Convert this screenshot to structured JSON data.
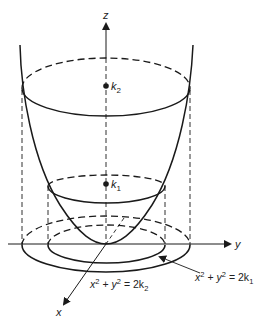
{
  "figure": {
    "type": "3D paraboloid with level curves",
    "axes": {
      "z_label": "z",
      "y_label": "y",
      "x_label": "x"
    },
    "points": {
      "k2_label": "k",
      "k2_sub": "2",
      "k1_label": "k",
      "k1_sub": "1"
    },
    "equations": {
      "outer": {
        "lhs_x": "x",
        "lhs_y": "y",
        "exp": "2",
        "rhs": "= 2k",
        "sub": "2",
        "plus": "+"
      },
      "inner": {
        "lhs_x": "x",
        "lhs_y": "y",
        "exp": "2",
        "rhs": "= 2k",
        "sub": "1",
        "plus": "+"
      }
    },
    "colors": {
      "line": "#1a1a1a",
      "background": "#ffffff"
    }
  }
}
